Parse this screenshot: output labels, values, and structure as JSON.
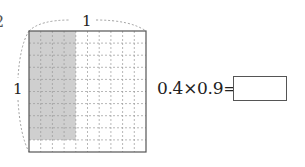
{
  "figure": {
    "problem_number_partial": "2",
    "top_label": "1",
    "left_label": "1",
    "grid": {
      "rows": 10,
      "cols": 10,
      "shaded_cols": 4,
      "shaded_rows": 9,
      "shade_color": "#cfcfcf",
      "line_color": "#999999",
      "border_color": "#555555"
    }
  },
  "equation": {
    "text": "0.4×0.9=",
    "answer": ""
  }
}
